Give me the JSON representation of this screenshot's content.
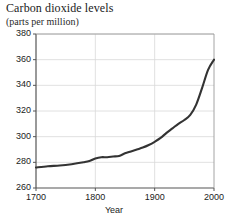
{
  "chart_data": {
    "type": "line",
    "title": "Carbon dioxide levels",
    "subtitle": "(parts per million)",
    "xlabel": "Year",
    "ylabel": "",
    "xlim": [
      1700,
      2000
    ],
    "ylim": [
      260,
      380
    ],
    "xticks": [
      1700,
      1800,
      1900,
      2000
    ],
    "yticks": [
      260,
      280,
      300,
      320,
      340,
      360,
      380
    ],
    "xtick_labels": [
      "1700",
      "1800",
      "1900",
      "2000"
    ],
    "ytick_labels": [
      "260",
      "280",
      "300",
      "320",
      "340",
      "360",
      "380"
    ],
    "grid": true,
    "legend": false,
    "line_color": "#333333",
    "grid_color": "#d8d8d8",
    "axis_color": "#555555",
    "series": [
      {
        "name": "Atmospheric CO2",
        "x": [
          1700,
          1720,
          1740,
          1760,
          1780,
          1790,
          1800,
          1810,
          1820,
          1830,
          1840,
          1850,
          1860,
          1870,
          1880,
          1890,
          1900,
          1910,
          1920,
          1930,
          1940,
          1950,
          1960,
          1970,
          1980,
          1990,
          2000
        ],
        "values": [
          276,
          277,
          277.5,
          278.5,
          280,
          281,
          283,
          284,
          284,
          284.5,
          285,
          287,
          288.5,
          290,
          291.5,
          293.5,
          296,
          299,
          303,
          306.5,
          310,
          313,
          317,
          325,
          338,
          352,
          360
        ]
      }
    ]
  }
}
